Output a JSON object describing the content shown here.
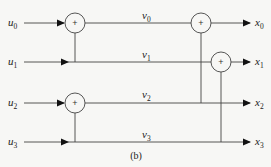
{
  "diagram": {
    "caption": "(b)",
    "inputs": [
      {
        "base": "u",
        "sub": "0"
      },
      {
        "base": "u",
        "sub": "1"
      },
      {
        "base": "u",
        "sub": "2"
      },
      {
        "base": "u",
        "sub": "3"
      }
    ],
    "intermediates": [
      {
        "base": "v",
        "sub": "0"
      },
      {
        "base": "v",
        "sub": "1"
      },
      {
        "base": "v",
        "sub": "2"
      },
      {
        "base": "v",
        "sub": "3"
      }
    ],
    "outputs": [
      {
        "base": "x",
        "sub": "0"
      },
      {
        "base": "x",
        "sub": "1"
      },
      {
        "base": "x",
        "sub": "2"
      },
      {
        "base": "x",
        "sub": "3"
      }
    ],
    "adder_symbol": "+",
    "stage1_adders": [
      {
        "sum_of": [
          "u0",
          "u1"
        ],
        "output": "v0"
      },
      {
        "sum_of": [
          "u2",
          "u3"
        ],
        "output": "v2"
      }
    ],
    "stage2_adders": [
      {
        "sum_of": [
          "v0",
          "v2"
        ],
        "output": "x0"
      },
      {
        "sum_of": [
          "v1",
          "v3"
        ],
        "output": "x1"
      }
    ],
    "passthrough": [
      {
        "from": "u1",
        "to": "v1"
      },
      {
        "from": "u3",
        "to": "v3"
      },
      {
        "from": "v2",
        "to": "x2"
      },
      {
        "from": "v3",
        "to": "x3"
      }
    ]
  }
}
